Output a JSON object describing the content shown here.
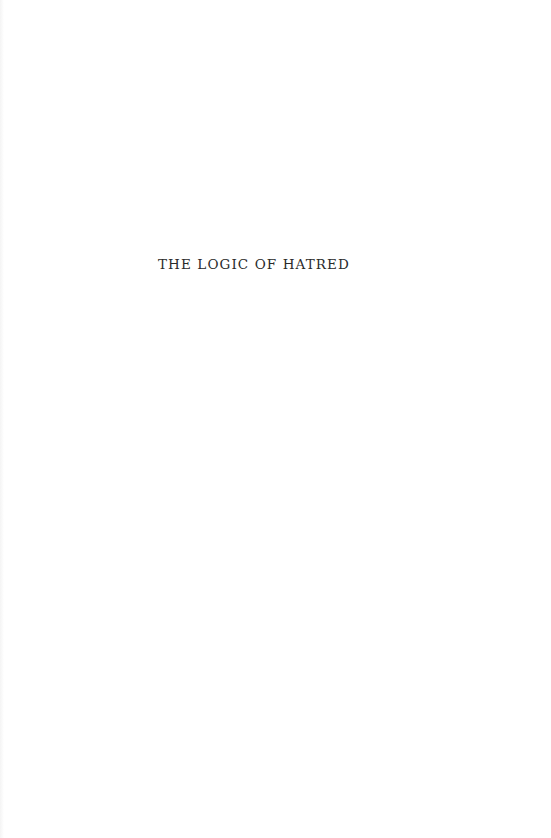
{
  "page": {
    "half_title": "THE LOGIC OF HATRED"
  }
}
